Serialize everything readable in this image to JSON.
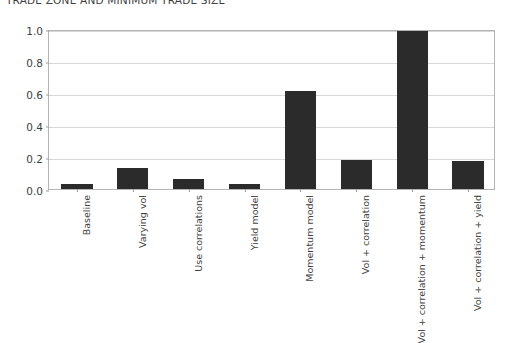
{
  "chart_data": {
    "type": "bar",
    "title": "TRADE ZONE AND MINIMUM TRADE SIZE",
    "xlabel": "",
    "ylabel": "",
    "grid": true,
    "legend": "none",
    "ylim": [
      0.0,
      1.0
    ],
    "yticks": [
      "0.0",
      "0.2",
      "0.4",
      "0.6",
      "0.8",
      "1.0"
    ],
    "ytick_values": [
      0.0,
      0.2,
      0.4,
      0.6,
      0.8,
      1.0
    ],
    "categories": [
      "Baseline",
      "Varying vol",
      "Use correlations",
      "Yield model",
      "Momentum model",
      "Vol + correlation",
      "Vol + correlation + momentum",
      "Vol + correlation + yield"
    ],
    "values": [
      0.03,
      0.13,
      0.065,
      0.03,
      0.61,
      0.18,
      0.99,
      0.175
    ],
    "bar_color": "#2b2b2b"
  }
}
